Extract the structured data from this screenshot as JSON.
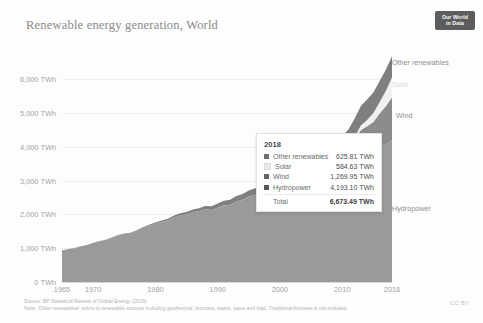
{
  "header": {
    "title": "Renewable energy generation, World",
    "badge_line1": "Our World",
    "badge_line2": "in Data"
  },
  "footer": {
    "source": "Source: BP Statistical Review of Global Energy (2019)",
    "note": "Note: 'Other renewables' refers to renewable sources including geothermal, biomass, waste, wave and tidal. Traditional biomass is not included.",
    "license": "CC BY"
  },
  "tooltip": {
    "year": "2018",
    "rows": [
      {
        "label": "Other renewables",
        "value": "625.81 TWh",
        "color": "#6f6f6f"
      },
      {
        "label": "Solar",
        "value": "584.63 TWh",
        "color": "#e8e8e8"
      },
      {
        "label": "Wind",
        "value": "1,269.95 TWh",
        "color": "#636363"
      },
      {
        "label": "Hydropower",
        "value": "4,193.10 TWh",
        "color": "#575757"
      }
    ],
    "total": {
      "label": "Total",
      "value": "6,673.49 TWh"
    }
  },
  "series_labels": [
    {
      "name": "Other renewables",
      "left": 392,
      "top": 58,
      "faint": false
    },
    {
      "name": "Solar",
      "left": 392,
      "top": 80,
      "faint": true
    },
    {
      "name": "Wind",
      "left": 396,
      "top": 111,
      "faint": false
    },
    {
      "name": "Hydropower",
      "left": 392,
      "top": 204,
      "faint": false
    }
  ],
  "chart_data": {
    "type": "area",
    "stacked": true,
    "title": "Renewable energy generation, World",
    "xlabel": "",
    "ylabel": "TWh",
    "unit": "TWh",
    "xlim": [
      1965,
      2018
    ],
    "ylim": [
      0,
      6800
    ],
    "grid": true,
    "legend_position": "right-series-labels",
    "yticks": [
      "0 TWh",
      "1,000 TWh",
      "2,000 TWh",
      "3,000 TWh",
      "4,000 TWh",
      "5,000 TWh",
      "6,000 TWh"
    ],
    "ytick_values": [
      0,
      1000,
      2000,
      3000,
      4000,
      5000,
      6000
    ],
    "xticks": [
      "1965",
      "1970",
      "1980",
      "1990",
      "2000",
      "2010",
      "2018"
    ],
    "xtick_values": [
      1965,
      1970,
      1980,
      1990,
      2000,
      2010,
      2018
    ],
    "x": [
      1965,
      1966,
      1967,
      1968,
      1969,
      1970,
      1971,
      1972,
      1973,
      1974,
      1975,
      1976,
      1977,
      1978,
      1979,
      1980,
      1981,
      1982,
      1983,
      1984,
      1985,
      1986,
      1987,
      1988,
      1989,
      1990,
      1991,
      1992,
      1993,
      1994,
      1995,
      1996,
      1997,
      1998,
      1999,
      2000,
      2001,
      2002,
      2003,
      2004,
      2005,
      2006,
      2007,
      2008,
      2009,
      2010,
      2011,
      2012,
      2013,
      2014,
      2015,
      2016,
      2017,
      2018
    ],
    "series": [
      {
        "name": "Hydropower",
        "color": "#9a9a9a",
        "values": [
          932,
          972,
          1000,
          1054,
          1089,
          1158,
          1204,
          1243,
          1301,
          1373,
          1419,
          1437,
          1510,
          1590,
          1662,
          1725,
          1778,
          1822,
          1914,
          1969,
          2000,
          2064,
          2096,
          2149,
          2127,
          2191,
          2262,
          2281,
          2375,
          2421,
          2511,
          2570,
          2609,
          2647,
          2672,
          2697,
          2599,
          2616,
          2654,
          2815,
          2938,
          3041,
          3093,
          3217,
          3250,
          3459,
          3493,
          3673,
          3857,
          3891,
          3900,
          4027,
          4060,
          4193
        ]
      },
      {
        "name": "Wind",
        "color": "#8c8c8c",
        "values": [
          0,
          0,
          0,
          0,
          0,
          0,
          0,
          0,
          0,
          0,
          0,
          0,
          0,
          0,
          0,
          0,
          0,
          0,
          0,
          0,
          0,
          0,
          0,
          0,
          0,
          4,
          5,
          6,
          7,
          8,
          8,
          9,
          12,
          15,
          21,
          31,
          38,
          52,
          63,
          85,
          104,
          133,
          171,
          220,
          276,
          342,
          437,
          524,
          636,
          712,
          832,
          958,
          1136,
          1270
        ]
      },
      {
        "name": "Solar",
        "color": "#f0f0f0",
        "values": [
          0,
          0,
          0,
          0,
          0,
          0,
          0,
          0,
          0,
          0,
          0,
          0,
          0,
          0,
          0,
          0,
          0,
          0,
          0,
          0,
          0,
          0,
          0,
          0,
          0,
          0,
          0,
          0,
          0,
          0,
          0,
          0,
          0,
          0,
          0,
          1,
          1,
          1,
          2,
          3,
          4,
          5,
          7,
          12,
          20,
          32,
          63,
          96,
          134,
          190,
          256,
          328,
          454,
          585
        ]
      },
      {
        "name": "Other renewables",
        "color": "#7f7f7f",
        "values": [
          1,
          2,
          2,
          3,
          4,
          5,
          7,
          9,
          11,
          13,
          16,
          19,
          22,
          26,
          30,
          35,
          40,
          46,
          53,
          60,
          69,
          78,
          88,
          99,
          111,
          124,
          136,
          147,
          158,
          170,
          183,
          196,
          210,
          224,
          238,
          253,
          268,
          284,
          301,
          320,
          340,
          363,
          388,
          417,
          447,
          480,
          513,
          543,
          575,
          600,
          615,
          621,
          623,
          626
        ]
      }
    ],
    "tooltip_year": 2018,
    "tooltip_total": 6673.49
  }
}
